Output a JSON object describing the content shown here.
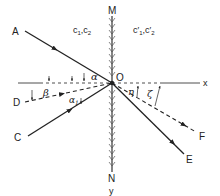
{
  "diagram": {
    "title": "",
    "interface": {
      "top_label": "M",
      "bottom_label": "N",
      "axis_label": "y"
    },
    "origin_label": "O",
    "x_axis_label": "x",
    "media": {
      "left": {
        "label": "c₁,c₂",
        "c_a": "c",
        "sub_a": "1",
        "c_b": "c",
        "sub_b": "2"
      },
      "right": {
        "label": "c′₁,c′₂",
        "c_a": "c′",
        "sub_a": "1",
        "c_b": "c′",
        "sub_b": "2"
      }
    },
    "rays": [
      {
        "id": "A",
        "label": "A",
        "style": "solid",
        "direction": "incident"
      },
      {
        "id": "C",
        "label": "C",
        "style": "solid",
        "direction": "incident"
      },
      {
        "id": "D",
        "label": "D",
        "style": "dashed",
        "direction": "incident"
      },
      {
        "id": "E",
        "label": "E",
        "style": "solid",
        "direction": "transmitted"
      },
      {
        "id": "F",
        "label": "F",
        "style": "dashed",
        "direction": "transmitted"
      }
    ],
    "angles": [
      {
        "symbol": "α",
        "between": "OA and x-axis"
      },
      {
        "symbol": "β",
        "between": "OD and x-axis"
      },
      {
        "symbol": "α",
        "sub": "1",
        "between": "OC and OD"
      },
      {
        "symbol": "η",
        "between": "OE and x-axis"
      },
      {
        "symbol": "ζ",
        "between": "OF and x-axis"
      }
    ],
    "colors": {
      "ink": "#222222",
      "background": "#ffffff"
    }
  }
}
